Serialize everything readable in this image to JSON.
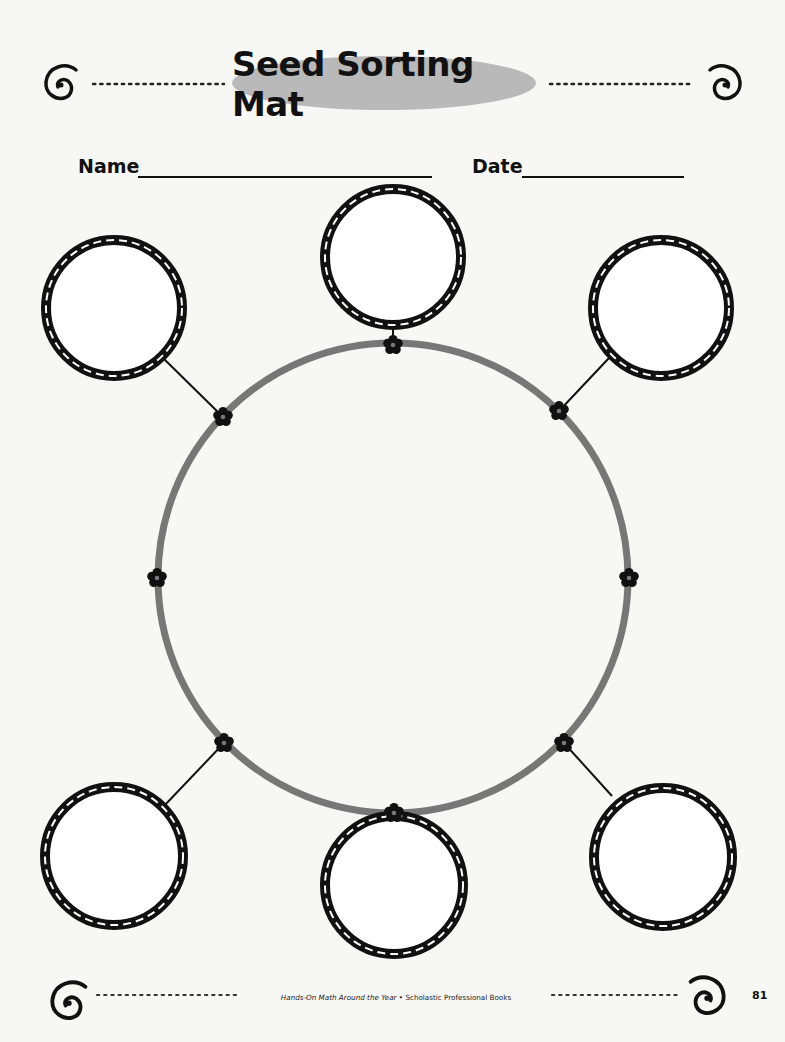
{
  "header": {
    "title": "Seed Sorting Mat",
    "title_bg_color": "#b9b9b9"
  },
  "fields": {
    "name_label": "Name",
    "name_value": "",
    "date_label": "Date",
    "date_value": ""
  },
  "diagram": {
    "center_ring": {
      "cx": 393,
      "cy": 578,
      "r": 236,
      "color": "#777777"
    },
    "flower_icon": "flower-icon",
    "sorting_circles": [
      {
        "id": "top",
        "cx": 393,
        "cy": 257,
        "r": 68,
        "attach": [
          393,
          344
        ]
      },
      {
        "id": "top-right",
        "cx": 661,
        "cy": 308,
        "r": 68,
        "attach": [
          559,
          411
        ]
      },
      {
        "id": "bottom-right",
        "cx": 663,
        "cy": 857,
        "r": 69,
        "attach": [
          564,
          743
        ]
      },
      {
        "id": "bottom",
        "cx": 394,
        "cy": 885,
        "r": 69,
        "attach": [
          394,
          813
        ]
      },
      {
        "id": "bottom-left",
        "cx": 114,
        "cy": 856,
        "r": 69,
        "attach": [
          224,
          743
        ]
      },
      {
        "id": "top-left",
        "cx": 114,
        "cy": 308,
        "r": 68,
        "attach": [
          223,
          417
        ]
      }
    ],
    "side_flowers": [
      [
        157,
        578
      ],
      [
        629,
        578
      ]
    ]
  },
  "footer": {
    "book_title": "Hands-On Math Around the Year",
    "separator": "•",
    "publisher": "Scholastic Professional Books",
    "page_number": "81"
  }
}
